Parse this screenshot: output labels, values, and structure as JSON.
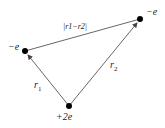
{
  "diagram": {
    "nodes": [
      {
        "id": "left",
        "charge": "−e",
        "x": 25,
        "y": 51
      },
      {
        "id": "right",
        "charge": "−e",
        "x": 140,
        "y": 19
      },
      {
        "id": "bottom",
        "charge": "+2e",
        "x": 69,
        "y": 106
      }
    ],
    "edges": [
      {
        "from": "bottom",
        "to": "left",
        "label": "r1",
        "arrow": true
      },
      {
        "from": "bottom",
        "to": "right",
        "label": "r2",
        "arrow": true
      },
      {
        "from": "left",
        "to": "right",
        "label": "|r1−r2|",
        "arrow": false
      }
    ],
    "labels": {
      "left_charge": "−e",
      "right_charge": "−e",
      "bottom_charge": "+2e",
      "r1": "r",
      "r1_sub": "1",
      "r2": "r",
      "r2_sub": "2",
      "distance": "|r1−r2|"
    },
    "colors": {
      "line": "#555555",
      "node": "#000000"
    }
  }
}
